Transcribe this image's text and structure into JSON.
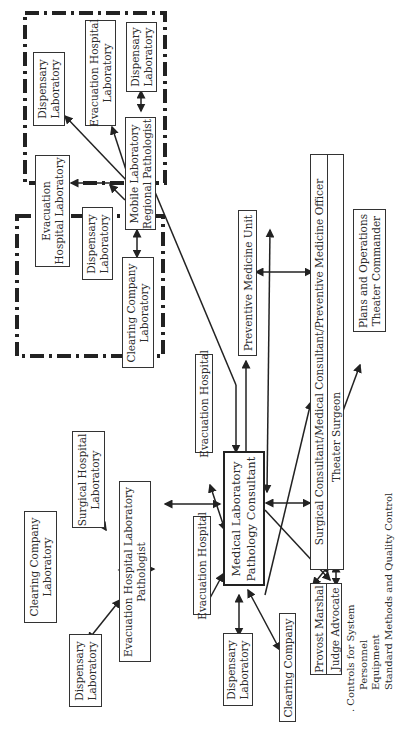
{
  "regions": {
    "upper_group_label": "Forward area (mobile laboratory region)",
    "lower_group_label": "Forward area (evacuation hospital region)"
  },
  "upper_group": {
    "mobile_lab": [
      "Mobile Laboratory",
      "Regional Pathologist"
    ],
    "dispensary_lab_1": [
      "Dispensary",
      "Laboratory"
    ],
    "evac_hosp_lab": [
      "Evacuation Hospital",
      "Laboratory"
    ],
    "dispensary_lab_2": [
      "Dispensary",
      "Laboratory"
    ],
    "evac_hosp_lab_2": [
      "Evacuation",
      "Hospital Laboratory"
    ],
    "dispensary_lab_3": [
      "Dispensary",
      "Laboratory"
    ],
    "clearing_company_lab": [
      "Clearing Company",
      "Laboratory"
    ]
  },
  "lower_group": {
    "clearing_company_lab": [
      "Clearing Company",
      "Laboratory"
    ],
    "surgical_hosp_lab": [
      "Surgical Hospital",
      "Laboratory"
    ],
    "evac_hosp_lab_pathologist": [
      "Evacuation Hospital Laboratory",
      "Pathologist"
    ],
    "dispensary_lab": [
      "Dispensary",
      "Laboratory"
    ]
  },
  "center": {
    "consultant": [
      "Medical Laboratory",
      "Pathology Consultant"
    ],
    "evac_hospital_upper": "Evacuation Hospital",
    "evac_hospital_lower": "Evacuation Hospital",
    "preventive_medicine_unit": "Preventive Medicine Unit",
    "surgical_consultant": "Surgical Consultant/Medical Consultant/Preventive Medicine Officer",
    "theater_surgeon": "Theater Surgeon",
    "plans_operations": [
      "Plans and Operations",
      "Theater Commander"
    ],
    "dispensary_lab": [
      "Dispensary",
      "Laboratory"
    ],
    "clearing_company": "Clearing Company",
    "provost_marshal": "Provost Marshal",
    "judge_advocate": "Judge Advocate"
  },
  "controls": {
    "title": ". Controls for System",
    "items": [
      "Personnel",
      "Equipment",
      "Standard Methods and Quality Control"
    ]
  },
  "colors": {
    "line": "#222222",
    "box_border": "#333333",
    "background": "#ffffff"
  }
}
